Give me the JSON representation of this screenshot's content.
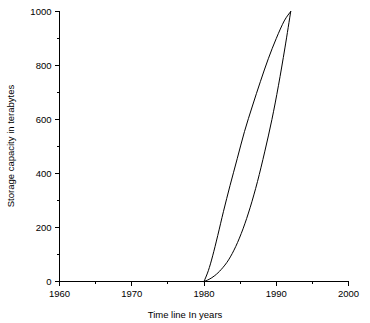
{
  "chart_data": {
    "type": "line",
    "title": "",
    "subtitle": "",
    "xlabel": "Time line In years",
    "ylabel": "Storage capacity in terabytes",
    "xlim": [
      1960,
      2000
    ],
    "ylim": [
      0,
      1000
    ],
    "x_major_ticks": [
      1960,
      1970,
      1980,
      1990,
      2000
    ],
    "x_major_tick_labels": [
      "1960",
      "1970",
      "1980",
      "1990",
      "2000"
    ],
    "x_minor_ticks": [
      1965,
      1975,
      1985,
      1995
    ],
    "y_major_ticks": [
      0,
      200,
      400,
      600,
      800,
      1000
    ],
    "y_major_tick_labels": [
      "0",
      "200",
      "400",
      "600",
      "800",
      "1000"
    ],
    "y_minor_ticks": [
      100,
      300,
      500,
      700,
      900
    ],
    "grid": false,
    "legend": false,
    "legend_position": "none",
    "line_color": "#000000",
    "background_color": "#ffffff",
    "series": [
      {
        "name": "upper-left-curve",
        "x": [
          1980.0,
          1980.6,
          1981.2,
          1981.9,
          1982.7,
          1983.6,
          1984.6,
          1985.6,
          1986.7,
          1987.8,
          1988.9,
          1990.0,
          1991.1,
          1992.0
        ],
        "values": [
          0,
          40,
          95,
          170,
          260,
          355,
          455,
          555,
          650,
          740,
          825,
          900,
          965,
          1000
        ]
      },
      {
        "name": "lower-right-curve",
        "x": [
          1980.0,
          1980.7,
          1981.5,
          1982.4,
          1983.4,
          1984.4,
          1985.4,
          1986.4,
          1987.4,
          1988.4,
          1989.4,
          1990.3,
          1991.2,
          1992.0
        ],
        "values": [
          0,
          8,
          22,
          45,
          80,
          130,
          195,
          275,
          370,
          480,
          600,
          725,
          865,
          1000
        ]
      }
    ]
  },
  "axis_titles": {
    "x": "Time line In years",
    "y": "Storage capacity in terabytes"
  }
}
